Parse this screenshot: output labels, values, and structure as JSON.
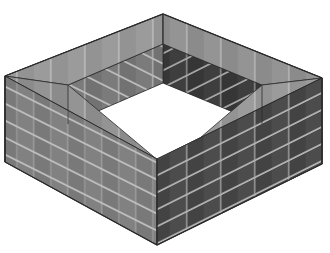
{
  "illustration": {
    "title": "Isometric hollow square brick wall enclosure",
    "subject": "brick-wall-enclosure",
    "background_color": "#ffffff",
    "canvas": {
      "width": 330,
      "height": 253
    },
    "projection": "isometric",
    "course_count": 5,
    "wall_sides": 4,
    "palette": {
      "outer_left_wall": "#7f7f7f",
      "outer_right_wall": "#4a4a4a",
      "inner_left_wall": "#3b3b3b",
      "inner_right_wall": "#767676",
      "top_cap": "#969696",
      "top_cap_shadow": "#8a8a8a",
      "mortar": "#c8c8c8",
      "mortar_dark": "#9a9a9a",
      "outline": "#2b2b2b",
      "hole_fill": "#ffffff"
    },
    "geometry": {
      "outer_top_apex": {
        "x": 163,
        "y": 14
      },
      "outer_left_corner": {
        "x": 5,
        "y": 76
      },
      "outer_right_corner": {
        "x": 322,
        "y": 78
      },
      "outer_bottom_corner": {
        "x": 157,
        "y": 245
      },
      "wall_height_px": 86,
      "wall_thickness_px": 26,
      "hole_center": {
        "x": 166,
        "y": 120
      }
    },
    "faces": [
      {
        "name": "outer-front-left-wall",
        "shade": "mid",
        "brick_rows": 5
      },
      {
        "name": "outer-front-right-wall",
        "shade": "dark",
        "brick_rows": 5
      },
      {
        "name": "outer-back-left-wall",
        "shade": "mid",
        "brick_rows": 5
      },
      {
        "name": "outer-back-right-wall",
        "shade": "dark",
        "brick_rows": 5
      },
      {
        "name": "inner-back-left-wall",
        "shade": "darkest",
        "brick_rows": 4
      },
      {
        "name": "inner-back-right-wall",
        "shade": "mid-light",
        "brick_rows": 4
      },
      {
        "name": "top-cap-ring",
        "shade": "light",
        "brick_rows": 1
      }
    ]
  }
}
